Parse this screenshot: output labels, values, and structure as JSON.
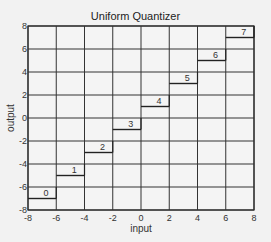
{
  "chart_data": {
    "type": "line",
    "title": "Uniform Quantizer",
    "xlabel": "input",
    "ylabel": "output",
    "xlim": [
      -8,
      8
    ],
    "ylim": [
      -8,
      8
    ],
    "grid": true,
    "x_ticks": [
      -8,
      -6,
      -4,
      -2,
      0,
      2,
      4,
      6,
      8
    ],
    "y_ticks": [
      -8,
      -6,
      -4,
      -2,
      0,
      2,
      4,
      6,
      8
    ],
    "steps": [
      {
        "level": "0",
        "x": [
          -8,
          -6
        ],
        "y": -7
      },
      {
        "level": "1",
        "x": [
          -6,
          -4
        ],
        "y": -5
      },
      {
        "level": "2",
        "x": [
          -4,
          -2
        ],
        "y": -3
      },
      {
        "level": "3",
        "x": [
          -2,
          0
        ],
        "y": -1
      },
      {
        "level": "4",
        "x": [
          0,
          2
        ],
        "y": 1
      },
      {
        "level": "5",
        "x": [
          2,
          4
        ],
        "y": 3
      },
      {
        "level": "6",
        "x": [
          4,
          6
        ],
        "y": 5
      },
      {
        "level": "7",
        "x": [
          6,
          8
        ],
        "y": 7
      }
    ]
  }
}
